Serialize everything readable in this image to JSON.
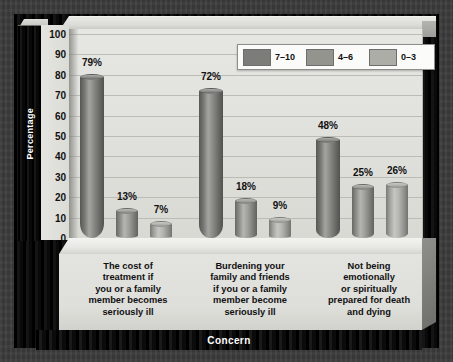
{
  "chart_data": {
    "type": "bar",
    "title": "",
    "xlabel": "Concern",
    "ylabel": "Percentage",
    "ylim": [
      0,
      100
    ],
    "yticks": [
      100,
      90,
      80,
      70,
      60,
      50,
      40,
      30,
      20,
      10,
      0
    ],
    "grid": true,
    "legend_position": "top-right",
    "style": "3d-cylinder",
    "categories": [
      "The cost of treatment if you or a family member becomes seriously ill",
      "Burdening your family and friends if you or a family member become seriously ill",
      "Not being emotionally or spiritually prepared for death and dying"
    ],
    "category_lines": [
      [
        "The cost of",
        "treatment if",
        "you or a family",
        "member becomes",
        "seriously ill"
      ],
      [
        "Burdening your",
        "family and friends",
        "if you or a family",
        "member become",
        "seriously ill"
      ],
      [
        "Not being",
        "emotionally",
        "or spiritually",
        "prepared for death",
        "and dying"
      ]
    ],
    "series": [
      {
        "name": "7–10",
        "color": "#7c7c78",
        "values": [
          79,
          72,
          48
        ],
        "labels": [
          "79%",
          "72%",
          "48%"
        ]
      },
      {
        "name": "4–6",
        "color": "#94948f",
        "values": [
          13,
          18,
          25
        ],
        "labels": [
          "13%",
          "18%",
          "25%"
        ]
      },
      {
        "name": "0–3",
        "color": "#adada8",
        "values": [
          7,
          9,
          26
        ],
        "labels": [
          "7%",
          "9%",
          "26%"
        ]
      }
    ]
  },
  "legend": {
    "items": [
      {
        "label": "7–10"
      },
      {
        "label": "4–6"
      },
      {
        "label": "0–3"
      }
    ]
  },
  "axes": {
    "y_title": "Percentage",
    "x_title": "Concern",
    "y_tick_labels": [
      "100",
      "90",
      "80",
      "70",
      "60",
      "50",
      "40",
      "30",
      "20",
      "10",
      "0"
    ]
  },
  "colors": {
    "series_dark": "#7c7c78",
    "series_mid": "#94948f",
    "series_light": "#adada8",
    "plot_background": "#e2e2de",
    "frame": "#000000",
    "backdrop": "#3c3c3c"
  }
}
